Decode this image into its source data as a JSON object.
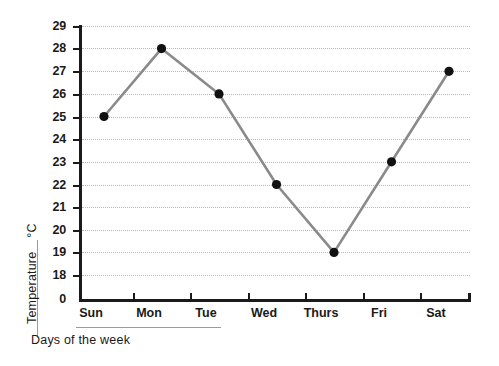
{
  "chart_data": {
    "type": "line",
    "title": "",
    "subtitle": "",
    "xlabel": "Days of the week",
    "ylabel": "Temperature",
    "yunit": "°C",
    "categories": [
      "Sun",
      "Mon",
      "Tue",
      "Wed",
      "Thurs",
      "Fri",
      "Sat"
    ],
    "values": [
      25,
      28,
      26,
      22,
      19,
      23,
      27
    ],
    "series": [
      {
        "name": "Temperature",
        "values": [
          25,
          28,
          26,
          22,
          19,
          23,
          27
        ]
      }
    ],
    "points": [
      {
        "category": "Sun",
        "value": 25
      },
      {
        "category": "Mon",
        "value": 28
      },
      {
        "category": "Tue",
        "value": 26
      },
      {
        "category": "Wed",
        "value": 22
      },
      {
        "category": "Thurs",
        "value": 19
      },
      {
        "category": "Fri",
        "value": 23
      },
      {
        "category": "Sat",
        "value": 27
      }
    ],
    "ytick_labels": [
      "29",
      "28",
      "27",
      "26",
      "25",
      "24",
      "23",
      "22",
      "21",
      "20",
      "19",
      "18",
      "0"
    ],
    "ytick_values": [
      29,
      28,
      27,
      26,
      25,
      24,
      23,
      22,
      21,
      20,
      19,
      18,
      0
    ],
    "ylim": [
      18,
      29
    ],
    "axis_break": true,
    "axis_break_note": "0 shown below 18 with a scale break",
    "xlim_categories": 7,
    "grid": true,
    "grid_style": "dotted",
    "legend": "none",
    "colors": {
      "line": "#8a8a8a",
      "marker": "#111111",
      "axis": "#1a1a1a",
      "grid": "#b9b9c4",
      "background": "#ffffff"
    }
  },
  "ylabels": {
    "t29": "29",
    "t28": "28",
    "t27": "27",
    "t26": "26",
    "t25": "25",
    "t24": "24",
    "t23": "23",
    "t22": "22",
    "t21": "21",
    "t20": "20",
    "t19": "19",
    "t18": "18",
    "t0": "0"
  },
  "xlabels": {
    "d0": "Sun",
    "d1": "Mon",
    "d2": "Tue",
    "d3": "Wed",
    "d4": "Thurs",
    "d5": "Fri",
    "d6": "Sat"
  },
  "axis_titles": {
    "y_name": "Temperature",
    "y_unit": "°C",
    "x_name": "Days of the week"
  }
}
